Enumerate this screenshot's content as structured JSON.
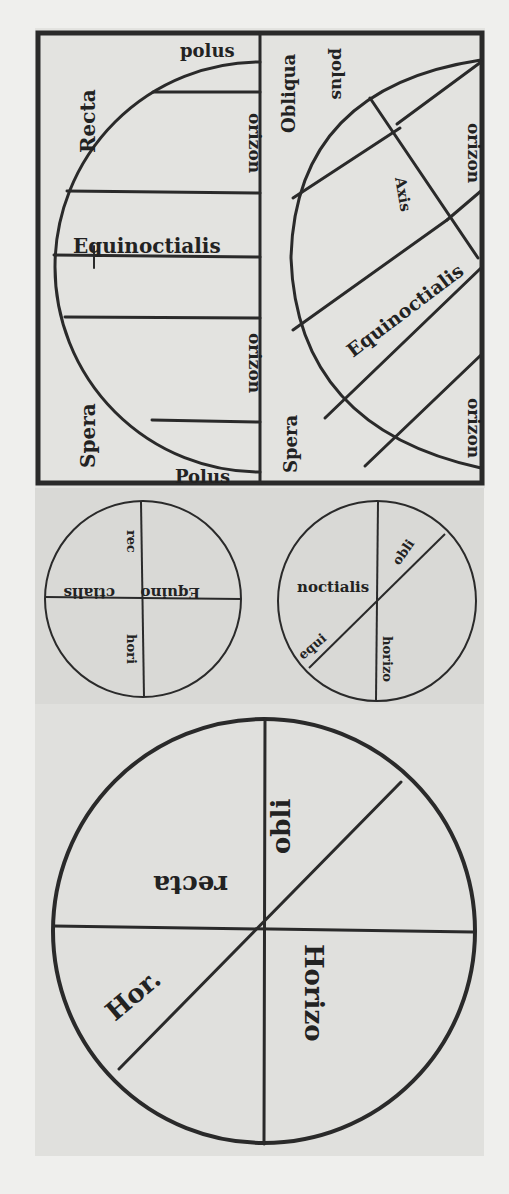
{
  "figure": {
    "colors": {
      "ink": "#2a2a2a",
      "paper": "#e2e2df",
      "background": "#efefed"
    }
  },
  "top_panel": {
    "left_diagram": {
      "title_top": "Recta",
      "title_bottom": "Spera",
      "pole_top": "polus",
      "pole_bottom": "Polus",
      "horizon_upper": "orizon",
      "horizon_lower": "orizon",
      "equator": "Equinoctialis"
    },
    "right_diagram": {
      "title_top": "Obliqua",
      "title_bottom": "Spera",
      "pole": "polus",
      "axis": "Axis",
      "horizon_upper": "orizon",
      "horizon_lower": "orizon",
      "equator": "Equinoctialis"
    }
  },
  "middle_panel": {
    "left_circle": {
      "labels": [
        "Equino",
        "ctialis",
        "rec",
        "hori"
      ]
    },
    "right_circle": {
      "labels": [
        "noctialis",
        "obli",
        "equi",
        "horizo"
      ]
    }
  },
  "bottom_panel": {
    "circle": {
      "labels": [
        "recta",
        "obli",
        "Hor.",
        "Horizo"
      ]
    }
  }
}
